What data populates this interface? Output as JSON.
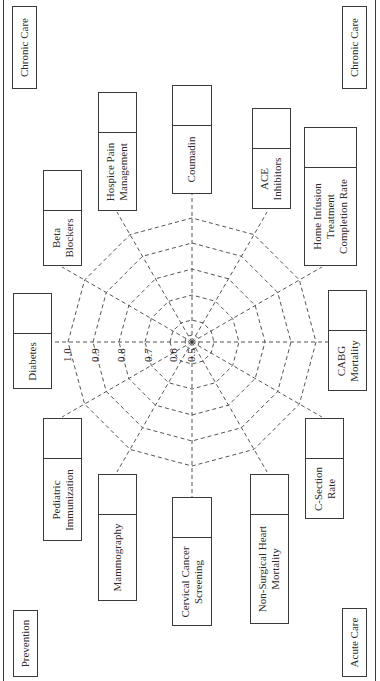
{
  "chart_data": {
    "type": "radar",
    "title": "",
    "orientation": "rotated 90 degrees counter-clockwise",
    "scale_ticks": [
      "1.0",
      "0.9",
      "0.8",
      "0.7",
      "0.6",
      "0.5"
    ],
    "range": [
      0.5,
      1.0
    ],
    "grid": "dashed concentric 12-gons",
    "axes": [
      "Diabetes",
      "Beta Blockers",
      "Hospice Pain Management",
      "Coumadin",
      "ACE Inhibitors",
      "Home Infusion Treatment Completion Rate",
      "CABG Mortality",
      "C-Section Rate",
      "Non-Surgical Heart Mortality",
      "Cervical Cancer Screening",
      "Mammography",
      "Pediatric Immunization"
    ],
    "values": [],
    "quadrant_labels": [
      "Chronic Care",
      "Chronic Care",
      "Prevention",
      "Acute Care"
    ]
  },
  "corners": {
    "top_left": "Chronic Care",
    "top_right": "Chronic Care",
    "bottom_left": "Prevention",
    "bottom_right": "Acute Care"
  },
  "measures": {
    "diabetes": [
      "Diabetes"
    ],
    "beta_blockers": [
      "Beta",
      "Blockers"
    ],
    "hospice": [
      "Hospice Pain",
      "Management"
    ],
    "coumadin": [
      "Coumadin"
    ],
    "ace": [
      "ACE",
      "Inhibitors"
    ],
    "home_infusion": [
      "Home Infusion",
      "Treatment",
      "Completion Rate"
    ],
    "cabg": [
      "CABG",
      "Mortality"
    ],
    "csection": [
      "C-Section",
      "Rate"
    ],
    "nonsurgical": [
      "Non-Surgical Heart",
      "Mortality"
    ],
    "cervical": [
      "Cervical Cancer",
      "Screening"
    ],
    "mammography": [
      "Mammography"
    ],
    "pediatric": [
      "Pediatric",
      "Immunization"
    ]
  },
  "ticks": [
    "1.0",
    "0.9",
    "0.8",
    "0.7",
    "0.6",
    "0.5"
  ]
}
